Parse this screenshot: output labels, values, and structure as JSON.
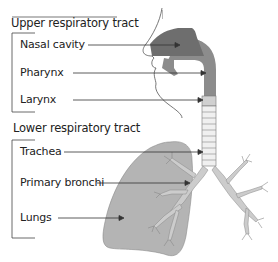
{
  "diagram": {
    "sections": [
      {
        "title": "Upper respiratory tract",
        "labels": [
          "Nasal cavity",
          "Pharynx",
          "Larynx"
        ]
      },
      {
        "title": "Lower respiratory tract",
        "labels": [
          "Trachea",
          "Primary bronchi",
          "Lungs"
        ]
      }
    ],
    "colors": {
      "nasal_fill": "#6e6e6e",
      "pharynx_fill": "#8c8c8c",
      "lung_fill": "#b4b4b4",
      "bronchi_fill": "#cccccc",
      "outline": "#555555",
      "text": "#222222",
      "leader_line": "#333333"
    }
  }
}
